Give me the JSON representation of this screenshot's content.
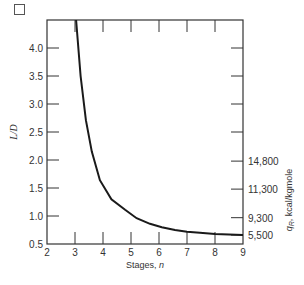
{
  "chart_data": {
    "type": "line",
    "title": "",
    "xlabel": "Stages, n",
    "ylabel": "L/D",
    "y2label": "q_R, kcal/kgmole",
    "xlim": [
      2,
      9
    ],
    "ylim": [
      0.5,
      4.5
    ],
    "x_ticks": [
      "2",
      "3",
      "4",
      "5",
      "6",
      "7",
      "8",
      "9"
    ],
    "y_ticks": [
      "0.5",
      "1.0",
      "1.5",
      "2.0",
      "2.5",
      "3.0",
      "3.5",
      "4.0"
    ],
    "y2_ticks": [
      {
        "label": "5,500",
        "at_LD": 0.66
      },
      {
        "label": "9,300",
        "at_LD": 0.97
      },
      {
        "label": "11,300",
        "at_LD": 1.48
      },
      {
        "label": "14,800",
        "at_LD": 1.98
      }
    ],
    "grid": false,
    "series": [
      {
        "name": "L/D vs stages",
        "x": [
          3.04,
          3.2,
          3.39,
          3.6,
          3.89,
          4.3,
          4.79,
          5.2,
          5.68,
          6.1,
          6.57,
          7.0,
          7.46,
          8.0,
          8.5,
          9.0
        ],
        "y": [
          4.5,
          3.5,
          2.71,
          2.15,
          1.64,
          1.3,
          1.11,
          0.96,
          0.86,
          0.8,
          0.75,
          0.72,
          0.7,
          0.68,
          0.67,
          0.66
        ]
      }
    ]
  },
  "ui": {
    "checkbox_checked": false
  }
}
